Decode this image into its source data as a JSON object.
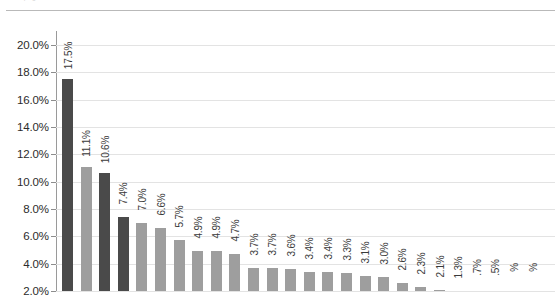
{
  "page": {
    "top_artifact_text": "cut-off page header text"
  },
  "chart_data": {
    "type": "bar",
    "title": "",
    "subtitle": "",
    "xlabel": "",
    "ylabel": "",
    "ylim": [
      2.0,
      20.0
    ],
    "ytick_step": 2.0,
    "grid": true,
    "legend": "none",
    "value_suffix": "%",
    "axis_tick_labels": [
      "20.0%",
      "18.0%",
      "16.0%",
      "14.0%",
      "12.0%",
      "10.0%",
      "8.0%",
      "6.0%",
      "4.0%",
      "2.0%"
    ],
    "axis_tick_values": [
      20.0,
      18.0,
      16.0,
      14.0,
      12.0,
      10.0,
      8.0,
      6.0,
      4.0,
      2.0
    ],
    "bar_colors": {
      "dark": "#4a4a4a",
      "light": "#9e9e9e"
    },
    "categories": [
      "",
      "",
      "",
      "",
      "",
      "",
      "",
      "",
      "",
      "",
      "",
      "",
      "",
      "",
      "",
      "",
      "",
      "",
      "",
      "",
      "",
      "",
      "",
      "",
      "",
      ""
    ],
    "values": [
      17.5,
      11.1,
      10.6,
      7.4,
      7.0,
      6.6,
      5.7,
      4.9,
      4.9,
      4.7,
      3.7,
      3.7,
      3.6,
      3.4,
      3.4,
      3.3,
      3.1,
      3.0,
      2.6,
      2.3,
      2.1,
      1.3,
      0.7,
      0.5,
      0.4,
      0.3
    ],
    "data_labels": [
      "17.5%",
      "11.1%",
      "10.6%",
      "7.4%",
      "7.0%",
      "6.6%",
      "5.7%",
      "4.9%",
      "4.9%",
      "4.7%",
      "3.7%",
      "3.7%",
      "3.6%",
      "3.4%",
      "3.4%",
      "3.3%",
      "3.1%",
      "3.0%",
      "2.6%",
      "2.3%",
      "2.1%",
      "1.3%",
      ".7%",
      ".5%",
      "%",
      "%"
    ],
    "series_shades": [
      "dark",
      "light",
      "dark",
      "dark",
      "light",
      "light",
      "light",
      "light",
      "light",
      "light",
      "light",
      "light",
      "light",
      "light",
      "light",
      "light",
      "light",
      "light",
      "light",
      "light",
      "light",
      "light",
      "light",
      "light",
      "light",
      "light"
    ]
  }
}
